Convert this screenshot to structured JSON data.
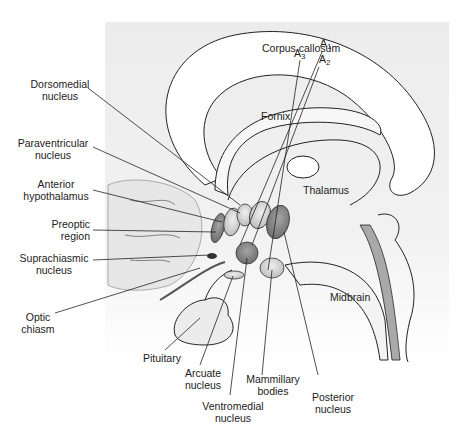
{
  "diagram": {
    "title_fragment": "",
    "structures": {
      "corpus_callosum": "Corpus callosum",
      "fornix": "Fornix",
      "thalamus": "Thalamus",
      "midbrain": "Midbrain"
    },
    "left_labels": [
      {
        "line1": "Dorsomedial",
        "line2": "nucleus"
      },
      {
        "line1": "Paraventricular",
        "line2": "nucleus"
      },
      {
        "line1": "Anterior",
        "line2": "hypothalamus"
      },
      {
        "line1": "Preoptic",
        "line2": "region"
      },
      {
        "line1": "Suprachiasmic",
        "line2": "nucleus"
      },
      {
        "line1": "Optic",
        "line2": "chiasm"
      }
    ],
    "bottom_labels": [
      {
        "line1": "Pituitary",
        "line2": ""
      },
      {
        "line1": "Arcuate",
        "line2": "nucleus"
      },
      {
        "line1": "Ventromedial",
        "line2": "nucleus"
      },
      {
        "line1": "Mammillary",
        "line2": "bodies"
      },
      {
        "line1": "Posterior",
        "line2": "nucleus"
      }
    ],
    "dopamine_groups": [
      {
        "letter": "A",
        "sub": "1"
      },
      {
        "letter": "A",
        "sub": "2"
      },
      {
        "letter": "A",
        "sub": "3"
      }
    ],
    "colors": {
      "panel": "#eeeeee",
      "outline": "#222222",
      "nucleus_dark": "#8a8a8a",
      "nucleus_light": "#d6d6d6",
      "ventricle": "#a9a9a9"
    }
  }
}
